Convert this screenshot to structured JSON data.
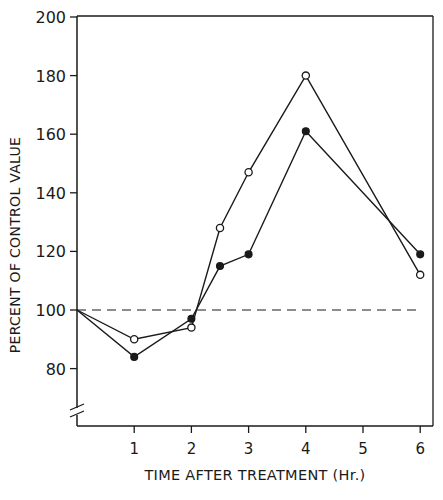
{
  "chart_data": {
    "type": "line",
    "title": "",
    "xlabel": "TIME AFTER TREATMENT (Hr.)",
    "ylabel": "PERCENT OF CONTROL VALUE",
    "xlim": [
      0,
      6.25
    ],
    "ylim": [
      60,
      200
    ],
    "x_ticks": [
      1,
      2,
      3,
      4,
      5,
      6
    ],
    "x_tick_labels": [
      "1",
      "2",
      "3",
      "4",
      "5",
      "6"
    ],
    "y_ticks": [
      80,
      100,
      120,
      140,
      160,
      180,
      200
    ],
    "y_tick_labels": [
      "80",
      "100",
      "120",
      "140",
      "160",
      "180",
      "200"
    ],
    "grid": false,
    "legend": null,
    "axis_break": "y-axis broken below 80",
    "reference_line": {
      "y": 100,
      "style": "dashed",
      "x_range": [
        0,
        6
      ]
    },
    "series": [
      {
        "name": "open-circles",
        "marker": "open-circle",
        "x": [
          0,
          1,
          2,
          2.5,
          3,
          4,
          6
        ],
        "values": [
          100,
          90,
          94,
          128,
          147,
          180,
          112
        ]
      },
      {
        "name": "filled-circles",
        "marker": "filled-circle",
        "x": [
          0,
          1,
          2,
          2.5,
          3,
          4,
          6
        ],
        "values": [
          100,
          84,
          97,
          115,
          119,
          161,
          119
        ]
      }
    ]
  },
  "colors": {
    "ink": "#1a1a1a",
    "background": "#ffffff"
  }
}
